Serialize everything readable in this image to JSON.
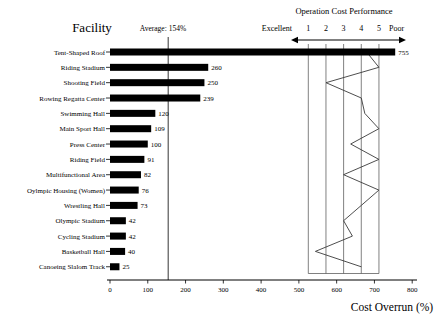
{
  "facility_header": "Facility",
  "average_label": "Average: 154%",
  "performance_scale": {
    "title": "Operation Cost Performance",
    "excellent": "Excellent",
    "poor": "Poor",
    "ticks": [
      "1",
      "2",
      "3",
      "4",
      "5"
    ]
  },
  "x_axis": {
    "tick_labels": [
      "0",
      "100",
      "200",
      "300",
      "400",
      "500",
      "600",
      "700",
      "800"
    ],
    "label": "Cost Overrun (%)"
  },
  "colors": {
    "bar": "#000000",
    "profile_line": "#3a3a3a",
    "scale_line": "#555555",
    "average_line": "#000000",
    "axis": "#000000",
    "background": "#ffffff",
    "text": "#000000"
  },
  "chart_data": {
    "type": "bar",
    "orientation": "horizontal",
    "value_series_name": "Cost Overrun (%)",
    "rating_series_name": "Operation Cost Performance",
    "rating_scale": {
      "min": 1,
      "max": 5,
      "min_label": "Excellent",
      "max_label": "Poor"
    },
    "average_value": 154,
    "xlabel": "Cost Overrun (%)",
    "xlim": [
      0,
      800
    ],
    "x_ticks": [
      0,
      100,
      200,
      300,
      400,
      500,
      600,
      700,
      800
    ],
    "rows": [
      {
        "facility": "Tent-Shaped Roof",
        "cost_overrun": 755,
        "performance": 4.3
      },
      {
        "facility": "Riding Stadium",
        "cost_overrun": 260,
        "performance": 5
      },
      {
        "facility": "Shooting Field",
        "cost_overrun": 250,
        "performance": 2
      },
      {
        "facility": "Rowing Regatta Center",
        "cost_overrun": 239,
        "performance": 4
      },
      {
        "facility": "Swimming Hall",
        "cost_overrun": 120,
        "performance": 4.2
      },
      {
        "facility": "Main Sport Hall",
        "cost_overrun": 109,
        "performance": 5
      },
      {
        "facility": "Press Center",
        "cost_overrun": 100,
        "performance": 3.4
      },
      {
        "facility": "Riding Field",
        "cost_overrun": 91,
        "performance": 5
      },
      {
        "facility": "Multifunctional Area",
        "cost_overrun": 82,
        "performance": 3
      },
      {
        "facility": "Oylmpic Housing (Women)",
        "cost_overrun": 76,
        "performance": 5
      },
      {
        "facility": "Wrestling Hall",
        "cost_overrun": 73,
        "performance": 4
      },
      {
        "facility": "Olympic Stadium",
        "cost_overrun": 42,
        "performance": 3
      },
      {
        "facility": "Cycling Stadium",
        "cost_overrun": 42,
        "performance": 3.5
      },
      {
        "facility": "Basketball Hall",
        "cost_overrun": 40,
        "performance": 1.4
      },
      {
        "facility": "Canoeing Slalom Track",
        "cost_overrun": 25,
        "performance": 4
      }
    ]
  }
}
